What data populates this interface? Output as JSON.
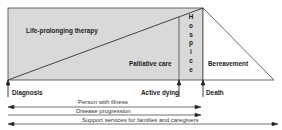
{
  "diagram": {
    "regions": {
      "life_prolonging": "Life-prolonging therapy",
      "palliative": "Palliative care",
      "hospice_letters": [
        "H",
        "o",
        "s",
        "p",
        "i",
        "c",
        "e"
      ],
      "bereavement": "Bereavement"
    },
    "milestones": {
      "diagnosis": "Diagnosis",
      "active_dying": "Active dying",
      "death": "Death"
    },
    "timelines": {
      "person": "Person with illness",
      "disease": "Disease progression",
      "support": "Support services for families and caregivers"
    },
    "colors": {
      "fill_gray": "#d9d9d9",
      "line": "#333333",
      "background": "#ffffff"
    }
  }
}
